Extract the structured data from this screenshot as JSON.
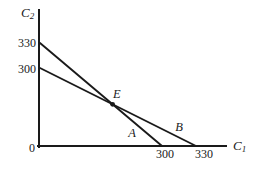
{
  "figure": {
    "colors": {
      "ink": "#1a1a1a",
      "background": "#ffffff"
    },
    "y_axis_label": {
      "base": "C",
      "sub": "2"
    },
    "x_axis_label": {
      "base": "C",
      "sub": "1"
    },
    "origin_label": "0",
    "y_ticks": [
      "330",
      "300"
    ],
    "x_ticks": [
      "300",
      "330"
    ],
    "point_labels": {
      "intersection": "E",
      "line_a": "A",
      "line_b": "B"
    },
    "lines": [
      {
        "label": "A",
        "y_intercept": 330,
        "x_intercept": 300
      },
      {
        "label": "B",
        "y_intercept": 300,
        "x_intercept": 330
      }
    ],
    "intersection": {
      "label": "E",
      "marker": "filled-dot"
    },
    "geometry": {
      "y_axis": {
        "x1": 39,
        "y1": 10,
        "x2": 39,
        "y2": 147
      },
      "x_axis": {
        "x1": 38,
        "y1": 146,
        "x2": 226,
        "y2": 146
      },
      "line_a": {
        "x1": 40,
        "y1": 43,
        "x2": 162,
        "y2": 146
      },
      "line_b": {
        "x1": 40,
        "y1": 68,
        "x2": 196,
        "y2": 146
      },
      "point_e": {
        "x": 112.6,
        "y": 104.3
      }
    }
  }
}
